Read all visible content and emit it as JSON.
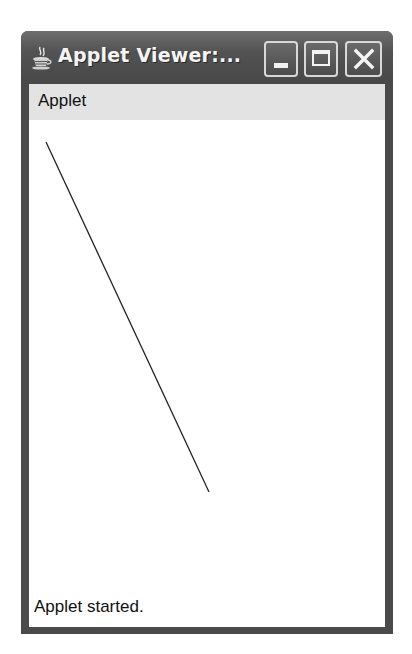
{
  "window": {
    "title": "Applet Viewer:...",
    "app_icon": "java-coffee-cup-icon",
    "controls": {
      "minimize": "minimize-icon",
      "maximize": "maximize-icon",
      "close": "close-icon"
    }
  },
  "menubar": {
    "items": [
      {
        "label": "Applet"
      }
    ]
  },
  "canvas": {
    "line": {
      "x1": 17,
      "y1": 22,
      "x2": 180,
      "y2": 372,
      "color": "#222222"
    }
  },
  "status": {
    "text": "Applet started."
  },
  "colors": {
    "titlebar": "#555555",
    "menubar": "#e3e3e3",
    "content": "#ffffff"
  }
}
